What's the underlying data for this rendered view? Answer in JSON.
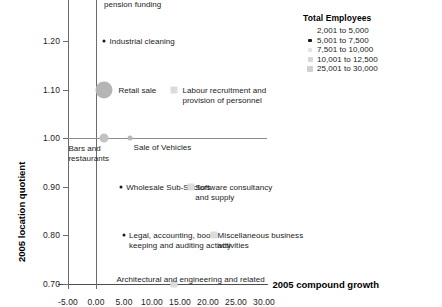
{
  "chart_data": {
    "type": "scatter",
    "title": "",
    "xlabel": "2005 compound growth",
    "ylabel": "2005 location quotient",
    "xlim": [
      -7.5,
      32.5
    ],
    "ylim": [
      0.66,
      1.33
    ],
    "xticks": [
      "-5.00",
      "0.00",
      "5.00",
      "10.00",
      "15.00",
      "20.00",
      "25.00",
      "30.00"
    ],
    "xtick_values": [
      -5,
      0,
      5,
      10,
      15,
      20,
      25,
      30
    ],
    "yticks": [
      "1.30",
      "1.20",
      "1.10",
      "1.00",
      "0.90",
      "0.80",
      "0.70"
    ],
    "ytick_values": [
      1.3,
      1.2,
      1.1,
      1.0,
      0.9,
      0.8,
      0.7
    ],
    "grid": false,
    "reference_lines": [
      {
        "name": "zero-growth-line",
        "axis": "x",
        "value": 0
      },
      {
        "name": "unit-quotient-line",
        "axis": "y",
        "value": 1.0
      },
      {
        "name": "baseline",
        "axis": "y",
        "value": 0.7
      }
    ],
    "size_encoding": "Total Employees",
    "legend_position": "top-right",
    "points": [
      {
        "label": "Insurance and\npension funding",
        "x": 0.0,
        "y": 1.3,
        "size_class": "m-small",
        "label_dx": 8,
        "label_dy": -3
      },
      {
        "label": "Industrial cleaning",
        "x": 1.5,
        "y": 1.2,
        "size_class": "m-tiny",
        "label_dx": 5,
        "label_dy": -4
      },
      {
        "label": "Retail sale",
        "x": 1.5,
        "y": 1.1,
        "size_class": "m-xlarge",
        "label_dx": 14,
        "label_dy": -4
      },
      {
        "label": "Labour recruitment and\nprovision of personnel",
        "x": 14.0,
        "y": 1.1,
        "size_class": "m-faint",
        "label_dx": 8,
        "label_dy": -4
      },
      {
        "label": "Bars and\nrestaurants",
        "x": 1.5,
        "y": 1.0,
        "size_class": "m-med",
        "label_dx": -36,
        "label_dy": 6
      },
      {
        "label": "Sale of Vehicles",
        "x": 6.0,
        "y": 1.0,
        "size_class": "m-small",
        "label_dx": 4,
        "label_dy": 5
      },
      {
        "label": "Wholesale Sub-Sectors",
        "x": 4.5,
        "y": 0.9,
        "size_class": "m-tiny",
        "label_dx": 5,
        "label_dy": -4
      },
      {
        "label": "Software consultancy\nand supply",
        "x": 17.0,
        "y": 0.9,
        "size_class": "m-faint",
        "label_dx": 4,
        "label_dy": -4
      },
      {
        "label": "Legal, accounting, book-\nkeeping and auditing activity",
        "x": 5.0,
        "y": 0.8,
        "size_class": "m-tiny",
        "label_dx": 5,
        "label_dy": -4
      },
      {
        "label": "Miscellaneous business\nactivities",
        "x": 21.0,
        "y": 0.8,
        "size_class": "m-faint",
        "label_dx": 4,
        "label_dy": -4
      },
      {
        "label": "Architectural and engineering and related",
        "x": 14.0,
        "y": 0.7,
        "size_class": "m-faint",
        "label_dx": -58,
        "label_dy": -9
      }
    ],
    "legend": {
      "title": "Total Employees",
      "entries": [
        {
          "label": "2,001 to 5,000",
          "swatch": "sw-1"
        },
        {
          "label": "5,001 to 7,500",
          "swatch": "sw-2"
        },
        {
          "label": "7,501 to 10,000",
          "swatch": "sw-3"
        },
        {
          "label": "10,001 to 12,500",
          "swatch": "sw-4"
        },
        {
          "label": "25,001 to 30,000",
          "swatch": "sw-5"
        }
      ]
    }
  }
}
